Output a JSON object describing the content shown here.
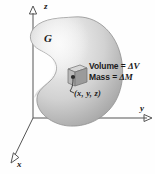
{
  "figure": {
    "background_color": "#fefefe",
    "axes": {
      "x_label": "x",
      "y_label": "y",
      "z_label": "z",
      "line_color": "#555555",
      "origin": {
        "x": 33,
        "y": 118
      }
    },
    "region": {
      "label": "G",
      "fill_light": "#ededed",
      "fill_mid": "#cfcfcf",
      "fill_dark": "#a2a2a2",
      "outline_color": "#8f8f8f"
    },
    "element": {
      "cube_face_color": "#b9b9b9",
      "cube_top_color": "#d6d6d6",
      "cube_side_color": "#9b9b9b",
      "point_color": "#2b2b2b",
      "point_label": "(x, y, z)",
      "callout_lines": [
        {
          "name": "Volume",
          "equals": "=",
          "value": "ΔV"
        },
        {
          "name": "Mass",
          "equals": "=",
          "value": "ΔM"
        }
      ]
    }
  }
}
